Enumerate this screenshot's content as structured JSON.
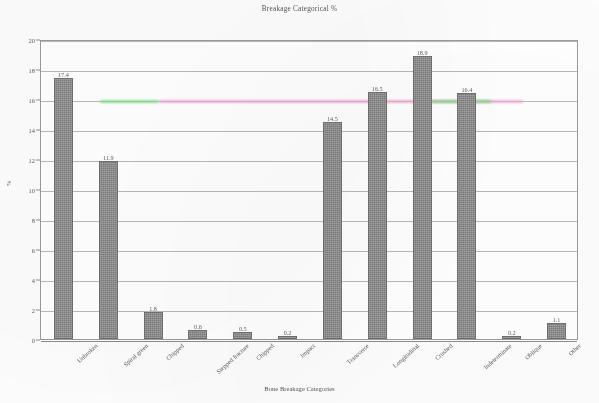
{
  "chart_data": {
    "type": "bar",
    "title": "Breakage Categorical %",
    "xlabel": "Bone Breakage Categories",
    "ylabel": "%",
    "ylim": [
      0,
      20
    ],
    "ytick_step": 2,
    "ytick_labels": [
      "0",
      "2",
      "4",
      "6",
      "8",
      "10",
      "12",
      "14",
      "16",
      "18",
      "20"
    ],
    "grid": "horizontal",
    "legend": "none",
    "bar_color": "#8d8d8d",
    "categories": [
      "Unbroken",
      "Spiral green",
      "Chipped",
      "Stepped fracture",
      "Chipped",
      "Impact",
      "Transverse",
      "Longitudinal",
      "Crushed",
      "Indeterminate",
      "Oblique",
      "Other"
    ],
    "values": [
      17.4,
      11.9,
      1.8,
      0.6,
      0.5,
      0.2,
      14.5,
      16.5,
      18.9,
      16.4,
      0.2,
      1.1
    ],
    "value_labels": [
      "17.4",
      "11.9",
      "1.8",
      "0.6",
      "0.5",
      "0.2",
      "14.5",
      "16.5",
      "18.9",
      "16.4",
      "0.2",
      "1.1"
    ],
    "artifacts": [
      {
        "name": "green-streak-left",
        "color": "#7fe08a",
        "left_pct": 11,
        "width_pct": 11,
        "value": 16
      },
      {
        "name": "pink-streak",
        "color": "#f0a9d4",
        "left_pct": 22,
        "width_pct": 68,
        "value": 16
      },
      {
        "name": "green-streak-right",
        "color": "#7fe08a",
        "left_pct": 73,
        "width_pct": 11,
        "value": 16
      }
    ]
  }
}
